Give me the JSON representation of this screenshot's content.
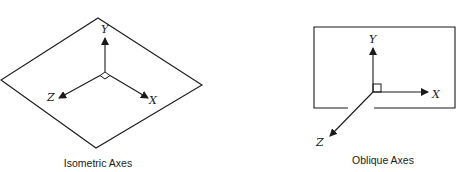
{
  "diagrams": [
    {
      "id": "isometric",
      "caption": "Isometric Axes",
      "plane_shape": "diamond",
      "axes": {
        "x": "X",
        "y": "Y",
        "z": "Z"
      },
      "right_angle_marker": "diamond"
    },
    {
      "id": "oblique",
      "caption": "Oblique Axes",
      "plane_shape": "rectangle",
      "axes": {
        "x": "X",
        "y": "Y",
        "z": "Z"
      },
      "right_angle_marker": "square"
    }
  ],
  "colors": {
    "line": "#1a1a1a",
    "background": "#ffffff"
  }
}
